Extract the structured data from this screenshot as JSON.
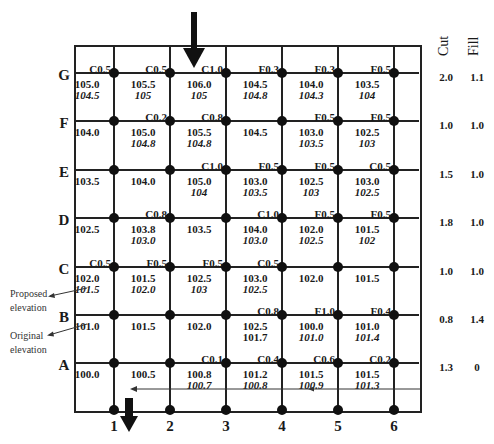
{
  "grid": {
    "rows": [
      "G",
      "F",
      "E",
      "D",
      "C",
      "B",
      "A"
    ],
    "columns": [
      "1",
      "2",
      "3",
      "4",
      "5",
      "6"
    ]
  },
  "cells": {
    "G": [
      {
        "cf": "C0.5",
        "orig": "105.0",
        "prop": "104.5"
      },
      {
        "cf": "C0.5",
        "orig": "105.5",
        "prop": "105"
      },
      {
        "cf": "C1.0",
        "orig": "106.0",
        "prop": "105"
      },
      {
        "cf": "F0.3",
        "orig": "104.5",
        "prop": "104.8"
      },
      {
        "cf": "F0.3",
        "orig": "104.0",
        "prop": "104.3"
      },
      {
        "cf": "F0.5",
        "orig": "103.5",
        "prop": "104"
      }
    ],
    "F": [
      {
        "cf": "",
        "orig": "104.0",
        "prop": ""
      },
      {
        "cf": "C0.2",
        "orig": "105.0",
        "prop": "104.8"
      },
      {
        "cf": "C0.8",
        "orig": "105.5",
        "prop": "104.8"
      },
      {
        "cf": "",
        "orig": "104.5",
        "prop": ""
      },
      {
        "cf": "F0.5",
        "orig": "103.0",
        "prop": "103.5"
      },
      {
        "cf": "F0.5",
        "orig": "102.5",
        "prop": "103"
      }
    ],
    "E": [
      {
        "cf": "",
        "orig": "103.5",
        "prop": ""
      },
      {
        "cf": "",
        "orig": "104.0",
        "prop": ""
      },
      {
        "cf": "C1.0",
        "orig": "105.0",
        "prop": "104"
      },
      {
        "cf": "F0.5",
        "orig": "103.0",
        "prop": "103.5"
      },
      {
        "cf": "F0.5",
        "orig": "102.5",
        "prop": "103"
      },
      {
        "cf": "C0.5",
        "orig": "103.0",
        "prop": "102.5"
      }
    ],
    "D": [
      {
        "cf": "",
        "orig": "102.5",
        "prop": ""
      },
      {
        "cf": "C0.8",
        "orig": "103.8",
        "prop": "103.0"
      },
      {
        "cf": "",
        "orig": "103.5",
        "prop": ""
      },
      {
        "cf": "C1.0",
        "orig": "104.0",
        "prop": "103.0"
      },
      {
        "cf": "F0.5",
        "orig": "102.0",
        "prop": "102.5"
      },
      {
        "cf": "F0.5",
        "orig": "101.5",
        "prop": "102"
      }
    ],
    "C": [
      {
        "cf": "C0.5",
        "orig": "102.0",
        "prop": "101.5"
      },
      {
        "cf": "F0.5",
        "orig": "101.5",
        "prop": "102.0"
      },
      {
        "cf": "F0.5",
        "orig": "102.5",
        "prop": "103"
      },
      {
        "cf": "C0.5",
        "orig": "103.0",
        "prop": "102.5"
      },
      {
        "cf": "",
        "orig": "102.0",
        "prop": ""
      },
      {
        "cf": "",
        "orig": "101.5",
        "prop": ""
      }
    ],
    "B": [
      {
        "cf": "",
        "orig": "101.0",
        "prop": ""
      },
      {
        "cf": "",
        "orig": "101.5",
        "prop": ""
      },
      {
        "cf": "",
        "orig": "102.0",
        "prop": ""
      },
      {
        "cf": "C0.8",
        "orig": "102.5",
        "prop": "101.7"
      },
      {
        "cf": "F1.0",
        "orig": "100.0",
        "prop": "101.0"
      },
      {
        "cf": "F0.4",
        "orig": "101.0",
        "prop": "101.4"
      }
    ],
    "A": [
      {
        "cf": "",
        "orig": "100.0",
        "prop": ""
      },
      {
        "cf": "",
        "orig": "100.5",
        "prop": ""
      },
      {
        "cf": "C0.1",
        "orig": "100.8",
        "prop": "100.7"
      },
      {
        "cf": "C0.4",
        "orig": "101.2",
        "prop": "100.8"
      },
      {
        "cf": "C0.6",
        "orig": "101.5",
        "prop": "100.9"
      },
      {
        "cf": "C0.2",
        "orig": "101.5",
        "prop": "101.3"
      }
    ]
  },
  "side_table": {
    "headers": {
      "cut": "Cut",
      "fill": "Fill"
    },
    "rows": [
      {
        "row": "G",
        "cut": "2.0",
        "fill": "1.1"
      },
      {
        "row": "F",
        "cut": "1.0",
        "fill": "1.0"
      },
      {
        "row": "E",
        "cut": "1.5",
        "fill": "1.0"
      },
      {
        "row": "D",
        "cut": "1.8",
        "fill": "1.0"
      },
      {
        "row": "C",
        "cut": "1.0",
        "fill": "1.0"
      },
      {
        "row": "B",
        "cut": "0.8",
        "fill": "1.4"
      },
      {
        "row": "A",
        "cut": "1.3",
        "fill": "0"
      }
    ]
  },
  "annotations": {
    "proposed": "Proposed elevation",
    "proposed_line1": "Proposed",
    "proposed_line2": "elevation",
    "original_line1": "Original",
    "original_line2": "elevation"
  },
  "colors": {
    "line": "#222222",
    "text": "#1a1a1a",
    "background": "#ffffff"
  }
}
